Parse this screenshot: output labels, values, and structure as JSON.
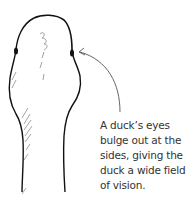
{
  "figure": {
    "caption_lines": [
      "A duck’s eyes",
      "bulge out at the",
      "sides, giving the",
      "duck a wide field",
      "of vision."
    ],
    "colors": {
      "ink": "#111111",
      "arrow": "#555555",
      "text": "#333333",
      "background": "#ffffff"
    }
  }
}
